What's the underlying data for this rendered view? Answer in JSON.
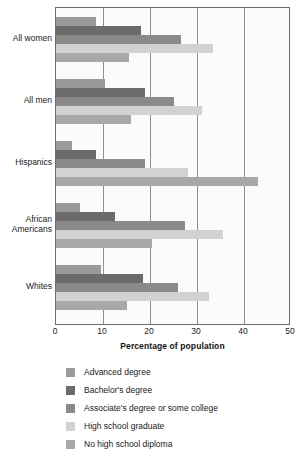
{
  "chart_data": {
    "type": "bar",
    "orientation": "horizontal",
    "title": "",
    "xlabel": "Percentage of population",
    "ylabel": "",
    "xlim": [
      0,
      50
    ],
    "xticks": [
      0,
      10,
      20,
      30,
      40,
      50
    ],
    "grid": true,
    "legend_position": "below",
    "categories": [
      "All women",
      "All men",
      "Hispanics",
      "African\nAmericans",
      "Whites"
    ],
    "series": [
      {
        "name": "Advanced degree",
        "color": "#9a9a9a",
        "values": [
          8.5,
          10.5,
          3.5,
          5.0,
          9.5
        ]
      },
      {
        "name": "Bachelor's degree",
        "color": "#6b6b6b",
        "values": [
          18.0,
          19.0,
          8.5,
          12.5,
          18.5
        ]
      },
      {
        "name": "Associate's degree or some college",
        "color": "#8a8a8a",
        "values": [
          26.5,
          25.0,
          19.0,
          27.5,
          26.0
        ]
      },
      {
        "name": "High school graduate",
        "color": "#d2d2d2",
        "values": [
          33.5,
          31.0,
          28.0,
          35.5,
          32.5
        ]
      },
      {
        "name": "No high school diploma",
        "color": "#a8a8a8",
        "values": [
          15.5,
          16.0,
          43.0,
          20.5,
          15.0
        ]
      }
    ]
  }
}
